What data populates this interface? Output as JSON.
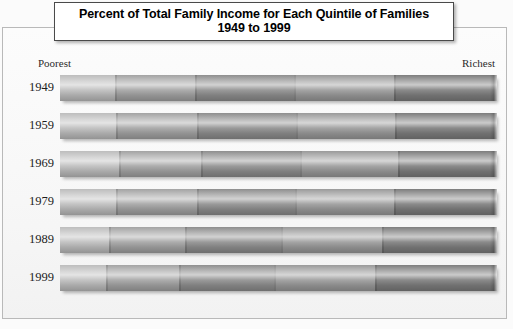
{
  "title": {
    "line1": "Percent of Total Family Income for Each Quintile of Families",
    "line2": "1949 to 1999"
  },
  "axis_labels": {
    "left_end": "Poorest",
    "right_end": "Richest"
  },
  "source_note": "",
  "colors": {
    "background": "#fbfbfb",
    "frame_border": "#b9b9b9",
    "title_border": "#4a4a4a",
    "title_background": "#ffffff",
    "text": "#1d1d1d",
    "quintile_1": "#bdbdbd",
    "quintile_2": "#a3a3a3",
    "quintile_3": "#8e8e8e",
    "quintile_4": "#9a9a9a",
    "quintile_5": "#7d7d7d"
  },
  "chart_data": {
    "type": "bar",
    "title": "Percent of Total Family Income for Each Quintile of Families 1949 to 1999",
    "subtitle": "1949 to 1999",
    "orientation": "horizontal",
    "stacked": true,
    "normalized_percent": true,
    "xlabel": "",
    "ylabel": "",
    "xlim": [
      0,
      100
    ],
    "grid": false,
    "legend_position": "none",
    "annotations": [
      "Poorest",
      "Richest"
    ],
    "categories": [
      "1949",
      "1959",
      "1969",
      "1979",
      "1989",
      "1999"
    ],
    "series": [
      {
        "name": "Poorest fifth",
        "values": [
          12.5,
          12.8,
          13.4,
          12.9,
          11.3,
          10.5
        ]
      },
      {
        "name": "Second fifth",
        "values": [
          18.4,
          18.5,
          18.9,
          18.4,
          17.4,
          16.8
        ]
      },
      {
        "name": "Middle fifth",
        "values": [
          22.7,
          22.6,
          22.6,
          22.4,
          21.9,
          21.7
        ]
      },
      {
        "name": "Fourth fifth",
        "values": [
          22.9,
          22.7,
          22.5,
          22.8,
          23.1,
          23.2
        ]
      },
      {
        "name": "Richest fifth",
        "values": [
          23.5,
          23.4,
          22.6,
          23.5,
          26.3,
          27.8
        ]
      }
    ]
  },
  "rows": [
    {
      "year": "1949",
      "segments": [
        12.5,
        18.4,
        22.7,
        22.9,
        23.5
      ]
    },
    {
      "year": "1959",
      "segments": [
        12.8,
        18.5,
        22.6,
        22.7,
        23.4
      ]
    },
    {
      "year": "1969",
      "segments": [
        13.4,
        18.9,
        22.6,
        22.5,
        22.6
      ]
    },
    {
      "year": "1979",
      "segments": [
        12.9,
        18.4,
        22.4,
        22.8,
        23.5
      ]
    },
    {
      "year": "1989",
      "segments": [
        11.3,
        17.4,
        21.9,
        23.1,
        26.3
      ]
    },
    {
      "year": "1999",
      "segments": [
        10.5,
        16.8,
        21.7,
        23.2,
        27.8
      ]
    }
  ]
}
